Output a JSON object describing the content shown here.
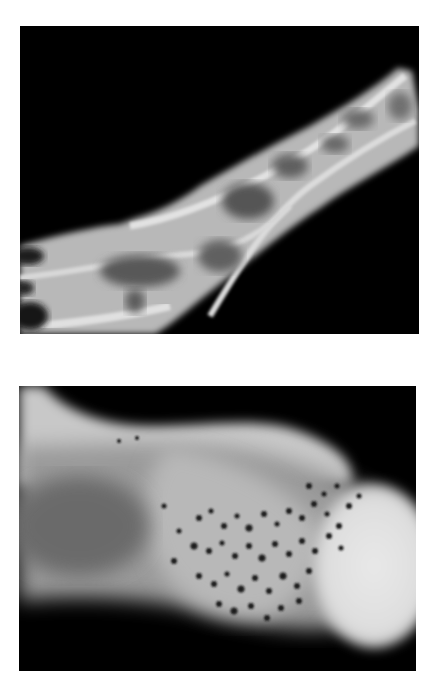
{
  "figure": {
    "panels": [
      {
        "id": "top",
        "description": "Grayscale radiograph of an elongated bone segment with trabecular/vascular pattern, oriented diagonally from lower-left to upper-right on black background",
        "background_color": "#000000",
        "tissue_color": "#bdbdbd",
        "highlight_color": "#e6e6e6"
      },
      {
        "id": "bottom",
        "description": "Grayscale radiograph of a bone end with a bright rounded head on the right and a cluster of small dark dots (perforations) in the central region",
        "background_color": "#000000",
        "tissue_color": "#a8a8a8",
        "highlight_color": "#e8e8e8",
        "dot_color": "#1a1a1a"
      }
    ]
  }
}
